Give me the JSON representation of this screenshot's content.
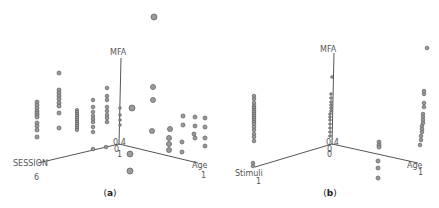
{
  "chart_data": [
    {
      "type": "scatter",
      "subtype": "3d-scatter",
      "caption": "(a)",
      "caption_letter": "a",
      "axes": {
        "vertical": {
          "label": "MFA"
        },
        "left": {
          "label": "SESSION",
          "end_tick": "6"
        },
        "right": {
          "label": "Age",
          "end_tick": "1"
        },
        "origin_labels": [
          "0.4",
          "0",
          "1"
        ]
      },
      "origin_px": [
        119,
        144
      ],
      "axis_ends_px": {
        "vertical": [
          121,
          58
        ],
        "left": [
          38,
          163
        ],
        "right": [
          198,
          163
        ]
      },
      "label_px": {
        "vertical": [
          110,
          55
        ],
        "left": [
          13,
          166
        ],
        "right": [
          192,
          168
        ],
        "left_tick": [
          34,
          180
        ],
        "right_tick": [
          201,
          178
        ],
        "origin": [
          [
            113,
            145
          ],
          [
            114,
            152
          ],
          [
            117,
            157
          ]
        ],
        "caption": [
          110,
          196
        ]
      },
      "points_px": [
        [
          154,
          17,
          3
        ],
        [
          59,
          73,
          2
        ],
        [
          59,
          90,
          2
        ],
        [
          59,
          93,
          2
        ],
        [
          59,
          96,
          2
        ],
        [
          59,
          99,
          2
        ],
        [
          59,
          103,
          2
        ],
        [
          59,
          106,
          2
        ],
        [
          59,
          113,
          2
        ],
        [
          59,
          128,
          2
        ],
        [
          37,
          102,
          2
        ],
        [
          37,
          105,
          2
        ],
        [
          37,
          108,
          2
        ],
        [
          37,
          111,
          2
        ],
        [
          37,
          113,
          2
        ],
        [
          37,
          115,
          2
        ],
        [
          37,
          117,
          2
        ],
        [
          37,
          123,
          2
        ],
        [
          37,
          126,
          2
        ],
        [
          37,
          130,
          2
        ],
        [
          37,
          137,
          2
        ],
        [
          77,
          110,
          1.6
        ],
        [
          77,
          112,
          1.6
        ],
        [
          77,
          114,
          1.6
        ],
        [
          77,
          116,
          1.6
        ],
        [
          77,
          118,
          1.6
        ],
        [
          77,
          120,
          1.6
        ],
        [
          77,
          122,
          1.6
        ],
        [
          77,
          124,
          1.6
        ],
        [
          77,
          126,
          1.6
        ],
        [
          77,
          128,
          1.6
        ],
        [
          77,
          130,
          1.6
        ],
        [
          93,
          100,
          1.8
        ],
        [
          93,
          107,
          1.8
        ],
        [
          93,
          112,
          1.8
        ],
        [
          93,
          116,
          1.8
        ],
        [
          93,
          119,
          1.8
        ],
        [
          93,
          122,
          1.8
        ],
        [
          93,
          127,
          1.8
        ],
        [
          93,
          132,
          1.8
        ],
        [
          107,
          88,
          1.8
        ],
        [
          107,
          96,
          1.8
        ],
        [
          107,
          100,
          1.8
        ],
        [
          107,
          107,
          1.8
        ],
        [
          107,
          111,
          1.8
        ],
        [
          107,
          115,
          1.8
        ],
        [
          107,
          118,
          1.8
        ],
        [
          107,
          122,
          1.8
        ],
        [
          120,
          108,
          1.3
        ],
        [
          120,
          115,
          1.3
        ],
        [
          120,
          120,
          1.3
        ],
        [
          120,
          125,
          1.3
        ],
        [
          93,
          149,
          1.8
        ],
        [
          106,
          147,
          1.8
        ],
        [
          132,
          108,
          3
        ],
        [
          130,
          154,
          3
        ],
        [
          130,
          171,
          3
        ],
        [
          153,
          87,
          2.5
        ],
        [
          153,
          100,
          2.5
        ],
        [
          152,
          131,
          2.5
        ],
        [
          170,
          129,
          2.5
        ],
        [
          169,
          138,
          2.5
        ],
        [
          169,
          144,
          2.5
        ],
        [
          169,
          150,
          2.5
        ],
        [
          183,
          116,
          2
        ],
        [
          183,
          125,
          2
        ],
        [
          182,
          142,
          2
        ],
        [
          182,
          152,
          2
        ],
        [
          195,
          117,
          2
        ],
        [
          195,
          126,
          2
        ],
        [
          194,
          134,
          2
        ],
        [
          195,
          138,
          2
        ],
        [
          205,
          118,
          2
        ],
        [
          205,
          127,
          2
        ],
        [
          205,
          138,
          2
        ],
        [
          205,
          146,
          2
        ]
      ]
    },
    {
      "type": "scatter",
      "subtype": "3d-scatter",
      "caption": "(b)",
      "caption_letter": "b",
      "axes": {
        "vertical": {
          "label": "MFA"
        },
        "left": {
          "label": "Stimuli",
          "end_tick": "1"
        },
        "right": {
          "label": "Age",
          "end_tick": "1"
        },
        "origin_labels": [
          "0.4",
          "0",
          "0"
        ]
      },
      "origin_px": [
        112,
        144
      ],
      "axis_ends_px": {
        "vertical": [
          114,
          53
        ],
        "left": [
          35,
          167
        ],
        "right": [
          198,
          163
        ]
      },
      "label_px": {
        "vertical": [
          100,
          52
        ],
        "left": [
          15,
          176
        ],
        "right": [
          187,
          168
        ],
        "left_tick": [
          36,
          184
        ],
        "right_tick": [
          198,
          175
        ],
        "origin": [
          [
            106,
            145
          ],
          [
            107,
            152
          ],
          [
            107,
            157
          ]
        ],
        "caption": [
          110,
          196
        ]
      },
      "points_px": [
        [
          34,
          96,
          1.8
        ],
        [
          34,
          99,
          1.8
        ],
        [
          34,
          103,
          1.8
        ],
        [
          34,
          106,
          1.8
        ],
        [
          34,
          108,
          1.8
        ],
        [
          34,
          110,
          1.8
        ],
        [
          34,
          112,
          1.8
        ],
        [
          34,
          114,
          1.8
        ],
        [
          34,
          116,
          1.8
        ],
        [
          34,
          118,
          1.8
        ],
        [
          34,
          120,
          1.8
        ],
        [
          34,
          122,
          1.8
        ],
        [
          34,
          124,
          1.8
        ],
        [
          34,
          127,
          1.8
        ],
        [
          34,
          130,
          1.8
        ],
        [
          34,
          134,
          1.8
        ],
        [
          34,
          137,
          1.8
        ],
        [
          34,
          141,
          1.8
        ],
        [
          33,
          163,
          1.8
        ],
        [
          33,
          166,
          1.8
        ],
        [
          112,
          77,
          1.3
        ],
        [
          111,
          94,
          1.3
        ],
        [
          111,
          98,
          1.3
        ],
        [
          111,
          102,
          1.3
        ],
        [
          111,
          105,
          1.3
        ],
        [
          111,
          108,
          1.3
        ],
        [
          111,
          111,
          1.3
        ],
        [
          110,
          114,
          1.3
        ],
        [
          110,
          117,
          1.3
        ],
        [
          110,
          120,
          1.3
        ],
        [
          110,
          124,
          1.3
        ],
        [
          110,
          128,
          1.3
        ],
        [
          110,
          132,
          1.3
        ],
        [
          110,
          136,
          1.3
        ],
        [
          159,
          142,
          2
        ],
        [
          159,
          145,
          2
        ],
        [
          159,
          147,
          2
        ],
        [
          158,
          161,
          2
        ],
        [
          158,
          168,
          2
        ],
        [
          158,
          178,
          2
        ],
        [
          207,
          48,
          1.8
        ],
        [
          204,
          91,
          1.8
        ],
        [
          204,
          94,
          1.8
        ],
        [
          204,
          103,
          1.8
        ],
        [
          204,
          107,
          1.8
        ],
        [
          203,
          114,
          1.8
        ],
        [
          203,
          117,
          1.8
        ],
        [
          203,
          120,
          1.8
        ],
        [
          203,
          123,
          1.8
        ],
        [
          202,
          126,
          1.8
        ],
        [
          202,
          129,
          1.8
        ],
        [
          202,
          132,
          1.8
        ],
        [
          201,
          136,
          1.8
        ],
        [
          201,
          140,
          1.8
        ],
        [
          200,
          145,
          1.8
        ]
      ]
    }
  ]
}
